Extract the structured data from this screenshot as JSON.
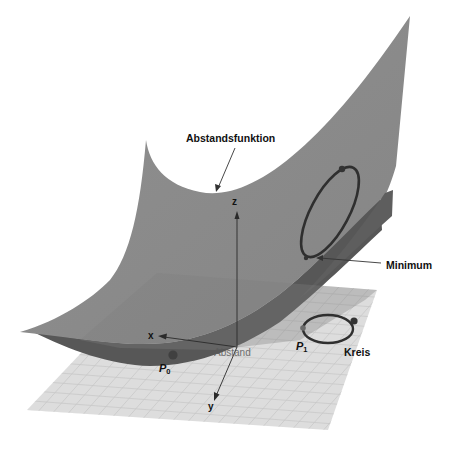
{
  "figure": {
    "labels": {
      "distance_function": "Abstandsfunktion",
      "minimum": "Minimum",
      "circle": "Kreis",
      "distance": "Abstand",
      "p0_base": "P",
      "p0_sub": "0",
      "p1_base": "P",
      "p1_sub": "1"
    },
    "axes": {
      "x": "x",
      "y": "y",
      "z": "z"
    },
    "colors": {
      "surface": "#8c8c8c",
      "surface_dark": "#555555",
      "plane": "#dcdcdc",
      "grid": "#c4c4c4",
      "curve": "#3a3a3a",
      "text": "#111111"
    }
  }
}
